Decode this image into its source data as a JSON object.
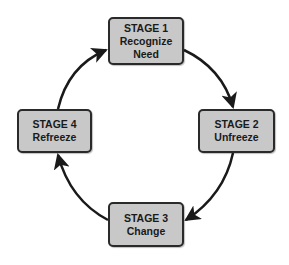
{
  "diagram": {
    "type": "cycle",
    "stages": [
      {
        "id": "s1",
        "title": "STAGE 1",
        "label_lines": [
          "Recognize",
          "Need"
        ]
      },
      {
        "id": "s2",
        "title": "STAGE 2",
        "label_lines": [
          "Unfreeze"
        ]
      },
      {
        "id": "s3",
        "title": "STAGE 3",
        "label_lines": [
          "Change"
        ]
      },
      {
        "id": "s4",
        "title": "STAGE 4",
        "label_lines": [
          "Refreeze"
        ]
      }
    ],
    "edges": [
      {
        "from": "STAGE 1",
        "to": "STAGE 2"
      },
      {
        "from": "STAGE 2",
        "to": "STAGE 3"
      },
      {
        "from": "STAGE 3",
        "to": "STAGE 4"
      },
      {
        "from": "STAGE 4",
        "to": "STAGE 1"
      }
    ],
    "colors": {
      "box_fill": "#c8c8c8",
      "box_border": "#2a2a2a",
      "arrow": "#1a1a1a",
      "text": "#1a1a1a"
    }
  }
}
